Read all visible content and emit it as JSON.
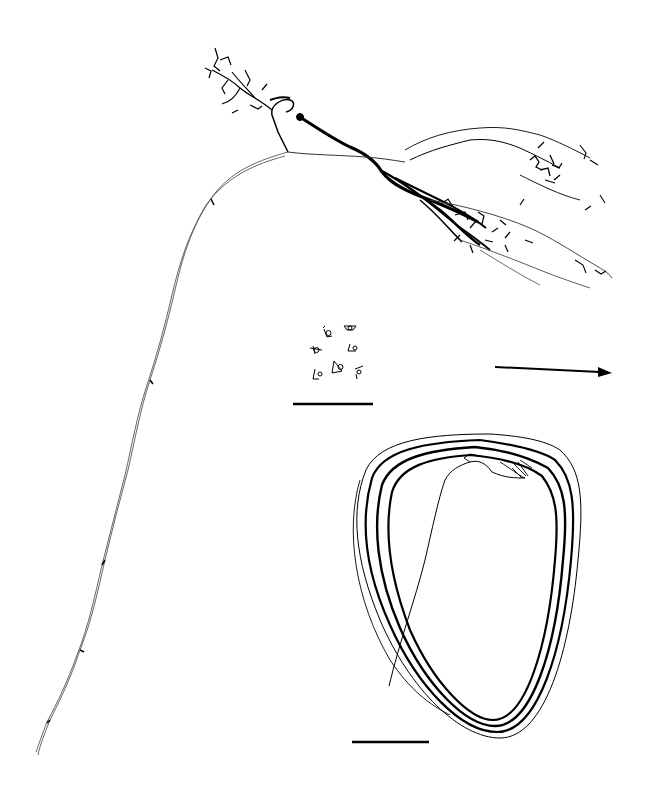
{
  "figure": {
    "background": "#ffffff",
    "ink_color": "#000000",
    "thin_ink_color": "#444444",
    "panels": [
      {
        "id": "neuron-arbor",
        "description": "Reconstructed neuron with dense axonal/dendritic arbor (upper right) and long descending axon (left)"
      },
      {
        "id": "cell-bodies-inset",
        "description": "Cluster of seven small cell-body outlines with scale bar below"
      },
      {
        "id": "direction-arrow",
        "description": "Horizontal arrow pointing right"
      },
      {
        "id": "looped-axon",
        "description": "Teardrop-shaped looping fiber bundle with scale bar below"
      }
    ],
    "scale_bars": [
      {
        "id": "scale-bar-inset",
        "x1": 293,
        "x2": 373,
        "y": 404
      },
      {
        "id": "scale-bar-loop",
        "x1": 352,
        "x2": 429,
        "y": 742
      }
    ],
    "arrow": {
      "x1": 495,
      "x2": 612,
      "y1": 367,
      "y2": 373
    }
  }
}
